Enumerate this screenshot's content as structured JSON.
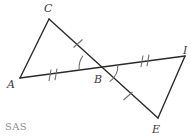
{
  "figure": {
    "type": "geometry-diagram",
    "width": 192,
    "height": 137,
    "background_color": "#ffffff",
    "stroke_color": "#2b2b2b",
    "mark_color": "#6e6e6e",
    "label_color": "#3a3a3a",
    "caption_color": "#8d8d8d"
  },
  "caption": {
    "text": "SAS",
    "x": 5,
    "y": 122
  },
  "vertices": [
    {
      "id": "A",
      "label": "A",
      "px": 20,
      "py": 78,
      "label_x": 7,
      "label_y": 79
    },
    {
      "id": "C",
      "label": "C",
      "px": 49,
      "py": 19,
      "label_x": 44,
      "label_y": 3
    },
    {
      "id": "B",
      "label": "B",
      "px": 99,
      "py": 67,
      "label_x": 94,
      "label_y": 74
    },
    {
      "id": "I",
      "label": "I",
      "px": 185,
      "py": 56,
      "label_x": 183,
      "label_y": 45
    },
    {
      "id": "E",
      "label": "E",
      "px": 158,
      "py": 118,
      "label_x": 152,
      "label_y": 124
    }
  ],
  "segments": [
    {
      "id": "AC",
      "from": "A",
      "to": "C",
      "ticks": 0
    },
    {
      "id": "AB",
      "from": "A",
      "to": "B",
      "ticks": 2
    },
    {
      "id": "CB",
      "from": "C",
      "to": "B",
      "ticks": 1
    },
    {
      "id": "BI",
      "from": "B",
      "to": "I",
      "ticks": 2
    },
    {
      "id": "BE",
      "from": "B",
      "to": "E",
      "ticks": 1
    },
    {
      "id": "IE",
      "from": "I",
      "to": "E",
      "ticks": 0
    }
  ],
  "angle_marks": [
    {
      "id": "angle-ABC",
      "at": "B",
      "arcs": 1,
      "note": "between ray BC and ray BA"
    },
    {
      "id": "angle-IBE",
      "at": "B",
      "arcs": 1,
      "note": "between ray BI and ray BE"
    }
  ],
  "congruence": {
    "statement": "SAS",
    "triangles": [
      "ABC",
      "IBE"
    ]
  }
}
